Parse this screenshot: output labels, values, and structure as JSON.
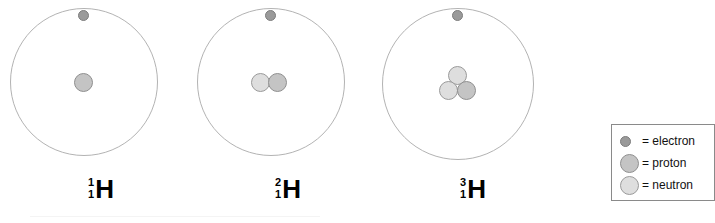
{
  "figure": {
    "title": "",
    "background_color": "#ffffff"
  },
  "colors": {
    "electron": "#9a9a9a",
    "proton": "#c4c4c4",
    "neutron": "#dedede",
    "orbit_stroke": "#b3b3b3",
    "legend_border": "#8a8a8a",
    "text": "#000000"
  },
  "atoms": [
    {
      "name": "protium",
      "element_symbol": "H",
      "mass_number": "1",
      "atomic_number": "1",
      "proton_count": 1,
      "neutron_count": 0,
      "electron_count": 1
    },
    {
      "name": "deuterium",
      "element_symbol": "H",
      "mass_number": "2",
      "atomic_number": "1",
      "proton_count": 1,
      "neutron_count": 1,
      "electron_count": 1
    },
    {
      "name": "tritium",
      "element_symbol": "H",
      "mass_number": "3",
      "atomic_number": "1",
      "proton_count": 1,
      "neutron_count": 2,
      "electron_count": 1
    }
  ],
  "legend": {
    "items": [
      {
        "marker": "electron-marker",
        "equals": "=",
        "label": "electron",
        "text": "=  electron"
      },
      {
        "marker": "proton-marker",
        "equals": "=",
        "label": "proton",
        "text": "=  proton"
      },
      {
        "marker": "neutron-marker",
        "equals": "=",
        "label": "neutron",
        "text": "=  neutron"
      }
    ]
  }
}
